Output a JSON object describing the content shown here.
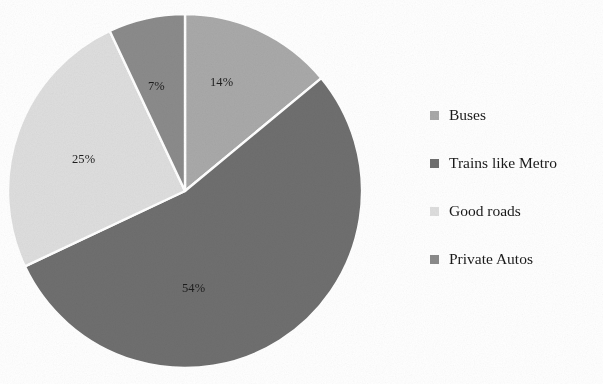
{
  "chart_data": {
    "type": "pie",
    "title": "",
    "categories": [
      "Buses",
      "Trains like Metro",
      "Good roads",
      "Private Autos"
    ],
    "values": [
      14,
      54,
      25,
      7
    ],
    "value_labels": [
      "14%",
      "54%",
      "25%",
      "7%"
    ],
    "colors": [
      "#a9a9a9",
      "#6f6f6f",
      "#dedede",
      "#8b8b8b"
    ],
    "units": "percent",
    "start_angle_deg": 0,
    "direction": "clockwise",
    "grid": false,
    "legend_position": "right",
    "slice_separator_color": "#ffffff",
    "slices": [
      {
        "label": "Buses",
        "value": 14,
        "display": "14%",
        "color": "#a9a9a9"
      },
      {
        "label": "Trains like Metro",
        "value": 54,
        "display": "54%",
        "color": "#6f6f6f"
      },
      {
        "label": "Good roads",
        "value": 25,
        "display": "25%",
        "color": "#dedede"
      },
      {
        "label": "Private Autos",
        "value": 7,
        "display": "7%",
        "color": "#8b8b8b"
      }
    ]
  },
  "legend": {
    "items": [
      {
        "label": "Buses",
        "color": "#a9a9a9"
      },
      {
        "label": "Trains like Metro",
        "color": "#6f6f6f"
      },
      {
        "label": "Good roads",
        "color": "#dedede"
      },
      {
        "label": "Private Autos",
        "color": "#8b8b8b"
      }
    ]
  },
  "labels": {
    "l0": "14%",
    "l1": "54%",
    "l2": "25%",
    "l3": "7%"
  }
}
